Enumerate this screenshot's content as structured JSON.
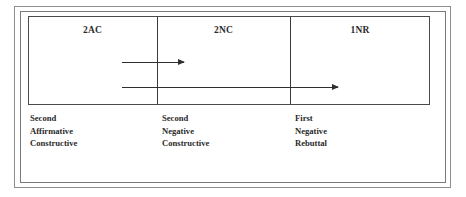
{
  "figure": {
    "table": {
      "columns": [
        {
          "header": "2AC",
          "caption": [
            "Second",
            "Affirmative",
            "Constructive"
          ]
        },
        {
          "header": "2NC",
          "caption": [
            "Second",
            "Negative",
            "Constructive"
          ]
        },
        {
          "header": "1NR",
          "caption": [
            "First",
            "Negative",
            "Rebuttal"
          ]
        }
      ]
    },
    "arrows": [
      {
        "name": "arrow-2ac-to-2nc",
        "direction": "right"
      },
      {
        "name": "arrow-2ac-to-1nr",
        "direction": "right"
      }
    ],
    "colors": {
      "frame_outer": "#8d8d8d",
      "frame_inner": "#7a7a7a",
      "table_border": "#4a4a4a",
      "divider": "#3a3a3a",
      "arrow": "#2e2e2e",
      "text": "#2b2b2b",
      "background": "#ffffff"
    }
  }
}
